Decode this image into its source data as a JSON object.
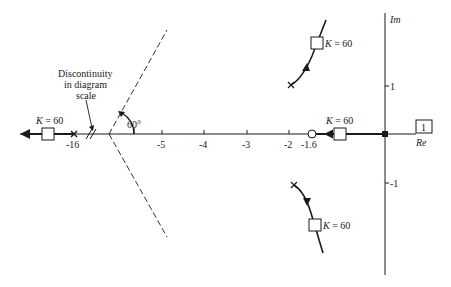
{
  "figure": {
    "type": "root-locus",
    "axes": {
      "real_label": "Re",
      "imag_label": "Im",
      "real_ticks": [
        {
          "label": "-5",
          "x": 162
        },
        {
          "label": "-4",
          "x": 204
        },
        {
          "label": "-3",
          "x": 247
        },
        {
          "label": "-2",
          "x": 289
        },
        {
          "label": "-1.6",
          "x": 312
        }
      ],
      "imag_ticks": [
        {
          "label": "1",
          "y": 86
        },
        {
          "label": "-1",
          "y": 183
        }
      ],
      "left_real_tick": {
        "label": "-16"
      }
    },
    "gain_box": {
      "label": "1"
    },
    "discontinuity_note": {
      "line1": "Discontinuity",
      "line2": "in diagram",
      "line3": "scale"
    },
    "asymptote_angle": "60°",
    "gain_labels": {
      "left": "K = 60",
      "real_right": "K = 60",
      "upper": "K = 60",
      "lower": "K = 60"
    },
    "poles": [
      {
        "name": "pole-origin",
        "re": 0,
        "im": 0
      },
      {
        "name": "pole-minus-16",
        "re": -16,
        "im": 0
      },
      {
        "name": "pole-upper-complex",
        "re": -2.1,
        "im": 1
      },
      {
        "name": "pole-lower-complex",
        "re": -2.1,
        "im": -1
      }
    ],
    "zeros": [
      {
        "name": "zero-minus-1.6",
        "re": -1.6,
        "im": 0
      }
    ],
    "colors": {
      "ink": "#1a1a1a",
      "background": "#ffffff"
    }
  }
}
